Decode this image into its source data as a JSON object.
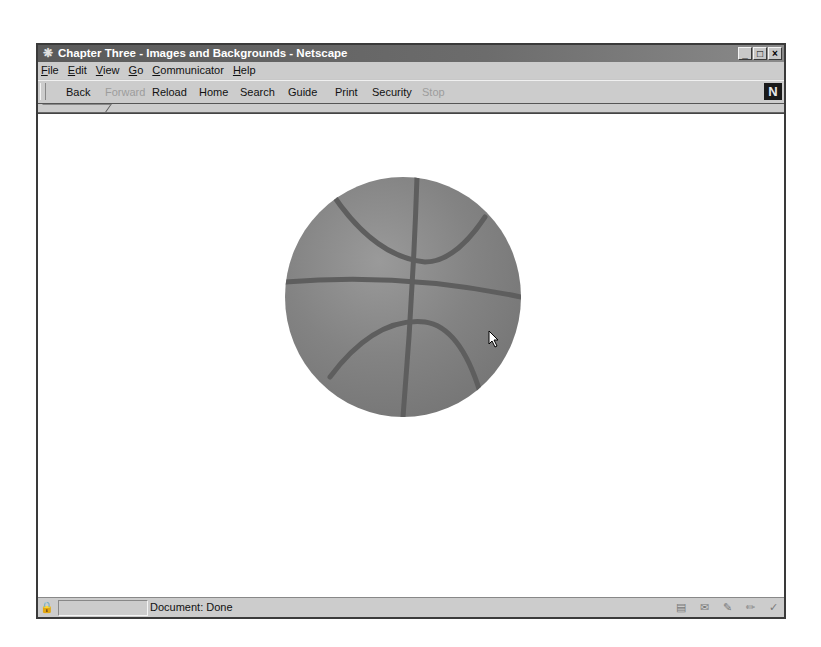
{
  "window": {
    "title": "Chapter Three - Images and Backgrounds - Netscape",
    "app_icon": "netscape-app-icon",
    "controls": {
      "minimize": "_",
      "maximize": "□",
      "close": "×"
    }
  },
  "menubar": {
    "items": [
      {
        "accel": "F",
        "rest": "ile"
      },
      {
        "accel": "E",
        "rest": "dit"
      },
      {
        "accel": "V",
        "rest": "iew"
      },
      {
        "accel": "G",
        "rest": "o"
      },
      {
        "accel": "C",
        "rest": "ommunicator"
      },
      {
        "accel": "H",
        "rest": "elp"
      }
    ]
  },
  "toolbar": {
    "buttons": [
      {
        "label": "Back",
        "enabled": true
      },
      {
        "label": "Forward",
        "enabled": false
      },
      {
        "label": "Reload",
        "enabled": true
      },
      {
        "label": "Home",
        "enabled": true
      },
      {
        "label": "Search",
        "enabled": true
      },
      {
        "label": "Guide",
        "enabled": true
      },
      {
        "label": "Print",
        "enabled": true
      },
      {
        "label": "Security",
        "enabled": true
      },
      {
        "label": "Stop",
        "enabled": false
      }
    ],
    "logo": "N"
  },
  "content": {
    "image": "basketball",
    "background": "#ffffff"
  },
  "statusbar": {
    "text": "Document: Done",
    "component_icons": [
      "navigator-icon",
      "mail-icon",
      "discussion-icon",
      "composer-icon",
      "conference-icon"
    ]
  }
}
